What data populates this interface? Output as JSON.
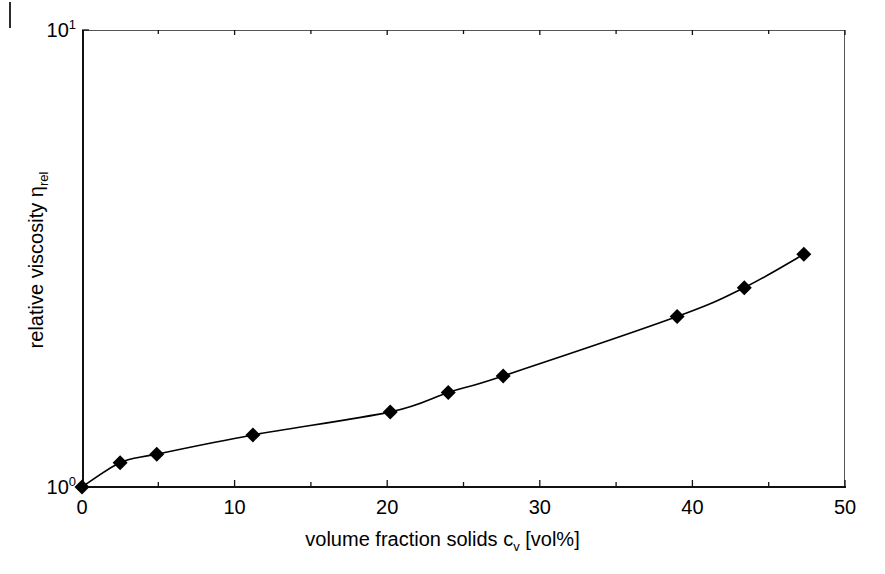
{
  "chart_data": {
    "type": "line",
    "title": "",
    "xlabel": "volume fraction solids c_v [vol%]",
    "ylabel": "relative viscosity η_rel",
    "xlabel_parts": {
      "main": "volume fraction solids c",
      "sub": "v",
      "tail": " [vol%]"
    },
    "ylabel_parts": {
      "main": "relative viscosity η",
      "sub": "rel"
    },
    "xscale": "linear",
    "yscale": "log",
    "xlim": [
      0,
      50
    ],
    "ylim": [
      1,
      10
    ],
    "grid": false,
    "legend": null,
    "xticks": [
      0,
      10,
      20,
      30,
      40,
      50
    ],
    "xtick_labels": [
      "0",
      "10",
      "20",
      "30",
      "40",
      "50"
    ],
    "xminor_ticks": [
      5,
      15,
      25,
      35,
      45
    ],
    "yticks": [
      1,
      10
    ],
    "ytick_labels": [
      {
        "mantissa": "10",
        "exponent": "0"
      },
      {
        "mantissa": "10",
        "exponent": "1"
      }
    ],
    "marker": "filled-diamond",
    "marker_color": "#000000",
    "line_color": "#000000",
    "series": [
      {
        "name": "relative viscosity",
        "x": [
          0.0,
          2.5,
          4.9,
          11.2,
          20.2,
          24.0,
          27.6,
          39.0,
          43.4,
          47.3
        ],
        "y": [
          1.0,
          1.13,
          1.18,
          1.3,
          1.46,
          1.61,
          1.75,
          2.36,
          2.73,
          3.23
        ]
      }
    ]
  },
  "axes": {
    "frame_color": "#555555",
    "axis_color": "#111111"
  },
  "artifacts": {
    "scan_mark": "vertical-scan-artifact"
  }
}
